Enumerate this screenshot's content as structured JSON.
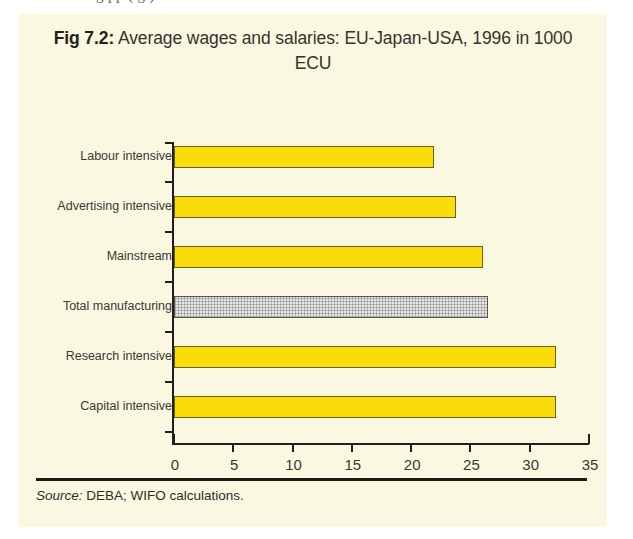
{
  "page": {
    "top_cut_text": "g  pp          (     g   )",
    "background_color": "#ffffff",
    "panel_color": "#fbf8e2"
  },
  "title": {
    "figure_number": "Fig 7.2:",
    "text": " Average wages and salaries: EU-Japan-USA, 1996 in 1000 ECU"
  },
  "source": {
    "lead": "Source:",
    "text": " DEBA; WIFO calculations."
  },
  "colors": {
    "bar_yellow": "#f9dc09",
    "bar_yellow_border": "#6d5f13",
    "bar_grey": "#e6e6e6",
    "bar_grey_border": "#55544f",
    "axis": "#211f1b",
    "text": "#3a3831"
  },
  "chart_data": {
    "type": "bar",
    "orientation": "horizontal",
    "title": "Fig 7.2: Average wages and salaries: EU-Japan-USA, 1996 in 1000 ECU",
    "xlabel": "",
    "ylabel": "",
    "xlim": [
      0,
      35
    ],
    "xticks": [
      "0",
      "5",
      "10",
      "15",
      "20",
      "25",
      "30",
      "35"
    ],
    "grid": false,
    "legend": false,
    "categories": [
      "Labour intensive",
      "Advertising intensive",
      "Mainstream",
      "Total manufacturing",
      "Research intensive",
      "Capital intensive"
    ],
    "values": [
      21.9,
      23.8,
      26.1,
      26.5,
      32.2,
      32.2
    ],
    "bar_styles": [
      "yellow",
      "yellow",
      "yellow",
      "grey",
      "yellow",
      "yellow"
    ],
    "units": "1000 ECU",
    "year": 1996
  }
}
